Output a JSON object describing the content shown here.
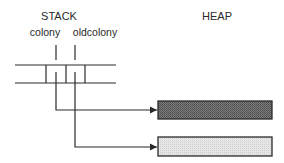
{
  "diagram": {
    "stack": {
      "title": "STACK",
      "variables": [
        {
          "name": "colony"
        },
        {
          "name": "oldcolony"
        }
      ]
    },
    "heap": {
      "title": "HEAP",
      "objects": [
        {
          "shade": "dark",
          "fill": "#6f6f6f",
          "pointed_by": "colony"
        },
        {
          "shade": "light",
          "fill": "#dedede",
          "pointed_by": "oldcolony"
        }
      ]
    },
    "colors": {
      "line": "#2a2a2a",
      "background": "#ffffff"
    }
  }
}
